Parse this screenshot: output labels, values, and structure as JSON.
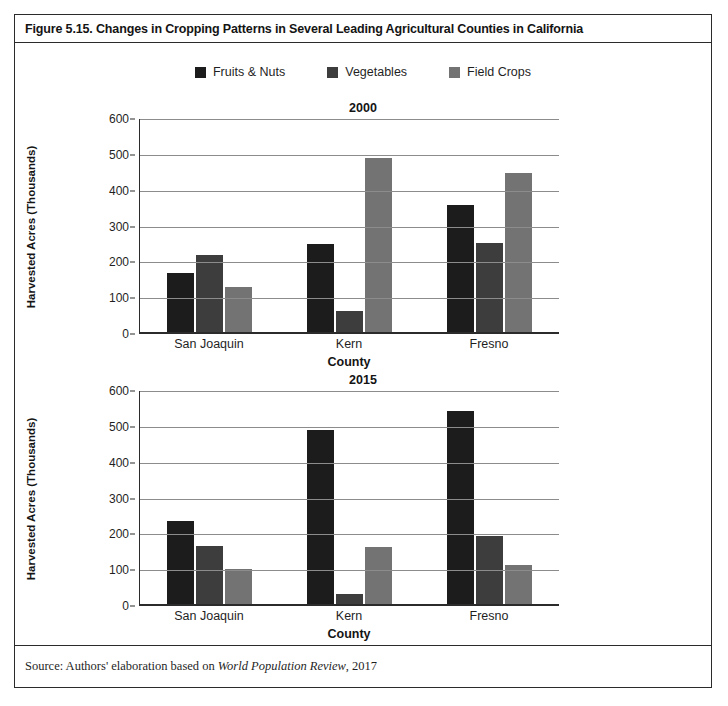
{
  "figure": {
    "title": "Figure 5.15. Changes in Cropping Patterns in Several Leading Agricultural Counties in California",
    "source_prefix": "Source: Authors' elaboration based on ",
    "source_work": "World Population Review",
    "source_suffix": ", 2017"
  },
  "legend": {
    "items": [
      {
        "label": "Fruits & Nuts",
        "color": "#1c1c1c"
      },
      {
        "label": "Vegetables",
        "color": "#3d3d3d"
      },
      {
        "label": "Field Crops",
        "color": "#737373"
      }
    ]
  },
  "chart_data": [
    {
      "type": "bar",
      "title": "2000",
      "xlabel": "County",
      "ylabel": "Harvested Acres (Thousands)",
      "categories": [
        "San Joaquin",
        "Kern",
        "Fresno"
      ],
      "ylim": [
        0,
        600
      ],
      "yticks": [
        0,
        100,
        200,
        300,
        400,
        500,
        600
      ],
      "grid": true,
      "legend_position": "top-center",
      "series": [
        {
          "name": "Fruits & Nuts",
          "color": "#1c1c1c",
          "values": [
            170,
            250,
            360
          ]
        },
        {
          "name": "Vegetables",
          "color": "#3d3d3d",
          "values": [
            220,
            65,
            253
          ]
        },
        {
          "name": "Field Crops",
          "color": "#737373",
          "values": [
            130,
            490,
            448
          ]
        }
      ]
    },
    {
      "type": "bar",
      "title": "2015",
      "xlabel": "County",
      "ylabel": "Harvested Acres (Thousands)",
      "categories": [
        "San Joaquin",
        "Kern",
        "Fresno"
      ],
      "ylim": [
        0,
        600
      ],
      "yticks": [
        0,
        100,
        200,
        300,
        400,
        500,
        600
      ],
      "grid": true,
      "legend_position": "top-center",
      "series": [
        {
          "name": "Fruits & Nuts",
          "color": "#1c1c1c",
          "values": [
            237,
            490,
            545
          ]
        },
        {
          "name": "Vegetables",
          "color": "#3d3d3d",
          "values": [
            168,
            33,
            195
          ]
        },
        {
          "name": "Field Crops",
          "color": "#737373",
          "values": [
            102,
            165,
            115
          ]
        }
      ]
    }
  ]
}
